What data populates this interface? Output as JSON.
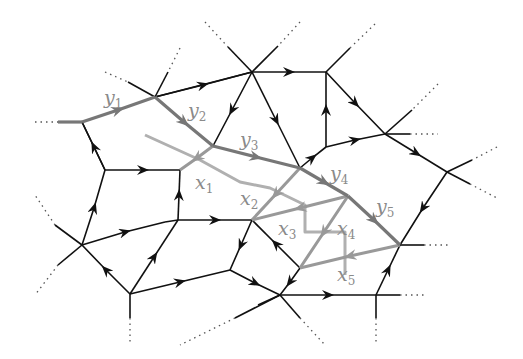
{
  "diagram": {
    "type": "directed planar network with highlighted paths",
    "colors": {
      "edge": "#111111",
      "path_y": "#777777",
      "path_x": "#b0b0b0",
      "path_x_cross": "#999999",
      "label": "#8a8a8a",
      "dotted": "#555555"
    },
    "labels": [
      {
        "id": "y1",
        "base": "y",
        "sub": "1",
        "x": 104,
        "y": 104
      },
      {
        "id": "y2",
        "base": "y",
        "sub": "2",
        "x": 188,
        "y": 117
      },
      {
        "id": "y3",
        "base": "y",
        "sub": "3",
        "x": 240,
        "y": 146
      },
      {
        "id": "y4",
        "base": "y",
        "sub": "4",
        "x": 330,
        "y": 180
      },
      {
        "id": "y5",
        "base": "y",
        "sub": "5",
        "x": 376,
        "y": 213
      },
      {
        "id": "x1",
        "base": "x",
        "sub": "1",
        "x": 195,
        "y": 189
      },
      {
        "id": "x2",
        "base": "x",
        "sub": "2",
        "x": 240,
        "y": 205
      },
      {
        "id": "x3",
        "base": "x",
        "sub": "3",
        "x": 278,
        "y": 235
      },
      {
        "id": "x4",
        "base": "x",
        "sub": "4",
        "x": 337,
        "y": 235
      },
      {
        "id": "x5",
        "base": "x",
        "sub": "5",
        "x": 337,
        "y": 281
      }
    ]
  }
}
